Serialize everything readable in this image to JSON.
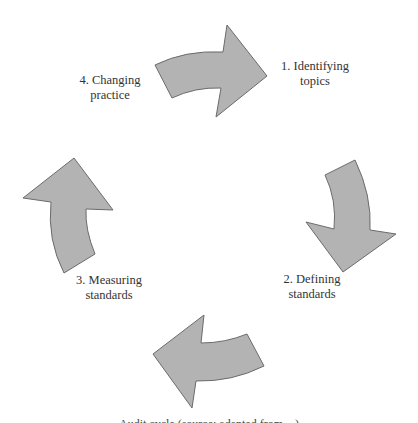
{
  "diagram": {
    "type": "cycle",
    "colors": {
      "arrow_fill": "#b3b3b3",
      "arrow_stroke": "#6b6b6b",
      "text": "#333333"
    },
    "steps": [
      {
        "number": "1.",
        "line1": "1. Identifying",
        "line2": "topics"
      },
      {
        "number": "2.",
        "line1": "2. Defining",
        "line2": "standards"
      },
      {
        "number": "3.",
        "line1": "3. Measuring",
        "line2": "standards"
      },
      {
        "number": "4.",
        "line1": "4. Changing",
        "line2": "practice"
      }
    ],
    "arrows": [
      {
        "from": "4. Changing practice",
        "to": "1. Identifying topics",
        "direction": "right"
      },
      {
        "from": "1. Identifying topics",
        "to": "2. Defining standards",
        "direction": "down"
      },
      {
        "from": "2. Defining standards",
        "to": "3. Measuring standards",
        "direction": "left"
      },
      {
        "from": "3. Measuring standards",
        "to": "4. Changing practice",
        "direction": "up"
      }
    ],
    "caption_partial": "Audit cycle (source: adapted from ...)"
  }
}
